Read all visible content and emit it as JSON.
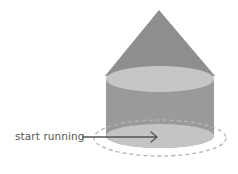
{
  "diagram": {
    "label": "start running",
    "colors": {
      "cone": "#8e8e8e",
      "cylinder_side": "#9a9a9a",
      "ellipse_face": "#c4c4c4",
      "dashed_path": "#b4b4b4",
      "arrow": "#555555",
      "label": "#555555"
    },
    "shapes": [
      "cone",
      "cylinder",
      "dashed-orbit",
      "arrow"
    ]
  }
}
